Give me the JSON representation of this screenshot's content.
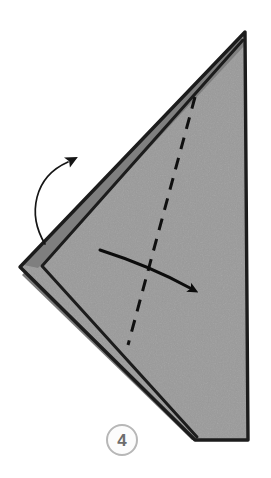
{
  "figure": {
    "kind": "origami-fold-instruction-diagram",
    "background_color": "#ffffff"
  },
  "step_badge": {
    "number": "4",
    "shape": "circle",
    "text_color": "#6d6d6d",
    "ring_color": "#b7b7b7",
    "fill_color": "#fcfcfc",
    "center_x": 122,
    "center_y": 440,
    "radius": 15
  },
  "paper": {
    "name": "folded-triangular-paper",
    "front_fill": "#9a9a9a",
    "shadow_fill": "#7d7d7d",
    "outline_color": "#1c1c1c",
    "outline_width": 3,
    "outline_points": "245,32 248,440 195,440 20,267",
    "top_vertex": "245,32",
    "right_bottom_vertex": "248,440",
    "bottom_left_vertex": "195,440",
    "left_vertex": "20,267"
  },
  "inner_flap": {
    "name": "under-layer-flap",
    "fill": "#8f8f8f",
    "edge_color": "#1c1c1c",
    "points": "243,38 246,436 198,436 42,266"
  },
  "fold_line": {
    "name": "valley-fold-dashed-line",
    "style": "dashed",
    "color": "#101010",
    "width": 3,
    "dash_pattern": "12 9",
    "start": "195,97",
    "end": "128,345"
  },
  "arrows": [
    {
      "name": "fold-over-straight-arrow",
      "type": "straight-fold-arrow",
      "color": "#0c0c0c",
      "description": "solid arrow sweeping right across the fold line",
      "path": "M 100,250 Q 150,266 192,289",
      "head_tip": "207,292",
      "direction": "right-down"
    },
    {
      "name": "turn-over-curved-arrow",
      "type": "curved-rotation-arrow",
      "color": "#151515",
      "description": "thin curved arrow on the left curling upward",
      "path": "M 45,244 C 28,216 34,178 66,163",
      "head_tip": "92,152",
      "direction": "up-right"
    }
  ]
}
